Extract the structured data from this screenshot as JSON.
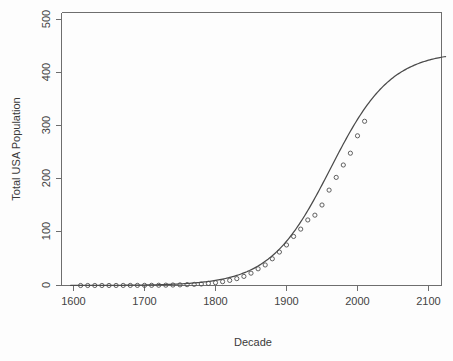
{
  "chart_data": {
    "type": "scatter",
    "title": "",
    "xlabel": "Decade",
    "ylabel": "Total USA Population",
    "xlim": [
      1590,
      2125
    ],
    "ylim": [
      -20,
      520
    ],
    "xticks": [
      1600,
      1700,
      1800,
      1900,
      2000,
      2100
    ],
    "xtick_labels": [
      "1600",
      "1700",
      "1800",
      "1900",
      "2000",
      "2100"
    ],
    "yticks": [
      0,
      100,
      200,
      300,
      400,
      500
    ],
    "ytick_labels": [
      "0",
      "100",
      "200",
      "300",
      "400",
      "500"
    ],
    "grid": false,
    "legend": "none",
    "point_style": "open-circle",
    "point_color": "#4f4f4f",
    "line_color": "#4a4a4a",
    "background_color": "#fdfdfd",
    "series": [
      {
        "name": "Observed population by decade",
        "type": "scatter",
        "x": [
          1610,
          1620,
          1630,
          1640,
          1650,
          1660,
          1670,
          1680,
          1690,
          1700,
          1710,
          1720,
          1730,
          1740,
          1750,
          1760,
          1770,
          1780,
          1790,
          1800,
          1810,
          1820,
          1830,
          1840,
          1850,
          1860,
          1870,
          1880,
          1890,
          1900,
          1910,
          1920,
          1930,
          1940,
          1950,
          1960,
          1970,
          1980,
          1990,
          2000,
          2010
        ],
        "values": [
          0.0,
          0.0,
          0.0,
          0.03,
          0.05,
          0.08,
          0.11,
          0.15,
          0.21,
          0.25,
          0.33,
          0.47,
          0.63,
          0.9,
          1.17,
          1.59,
          2.15,
          2.78,
          3.9,
          5.3,
          7.2,
          9.6,
          12.9,
          17.1,
          23.2,
          31.4,
          38.6,
          50.2,
          62.9,
          76.2,
          92.2,
          106.0,
          123.2,
          132.2,
          151.3,
          179.3,
          203.2,
          226.5,
          248.7,
          281.4,
          308.7
        ]
      },
      {
        "name": "Fitted logistic curve",
        "type": "line",
        "x": [
          1600,
          1620,
          1640,
          1660,
          1680,
          1700,
          1720,
          1740,
          1760,
          1780,
          1800,
          1820,
          1840,
          1860,
          1880,
          1900,
          1920,
          1940,
          1960,
          1980,
          2000,
          2020,
          2040,
          2060,
          2080,
          2100,
          2120
        ],
        "values": [
          0.3,
          0.5,
          0.7,
          1.0,
          1.5,
          2.2,
          3.2,
          4.6,
          6.7,
          9.6,
          13.7,
          19.4,
          27.3,
          38.0,
          52.2,
          70.5,
          93.4,
          121.1,
          153.1,
          188.3,
          225.0,
          260.7,
          293.1,
          320.9,
          343.7,
          361.6,
          375.4
        ],
        "asymptote": 440,
        "endpoint_value": 440
      }
    ],
    "annotations": []
  },
  "axes": {
    "x_title": "Decade",
    "y_title": "Total USA Population"
  }
}
